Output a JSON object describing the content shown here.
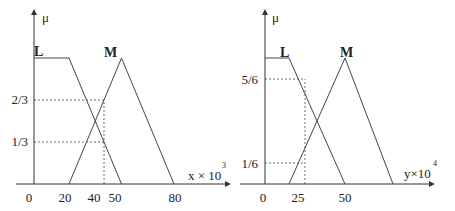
{
  "chart_data": [
    {
      "type": "line",
      "title": "",
      "ylabel": "μ",
      "xlabel": "x × 10",
      "xlabel_exponent": "3",
      "xticks": [
        "0",
        "20",
        "40",
        "50",
        "80"
      ],
      "yticks": [
        "1/3",
        "2/3"
      ],
      "series": [
        {
          "name": "L",
          "points": [
            [
              0,
              1
            ],
            [
              20,
              1
            ],
            [
              50,
              0
            ]
          ]
        },
        {
          "name": "M",
          "points": [
            [
              20,
              0
            ],
            [
              50,
              1
            ],
            [
              80,
              0
            ]
          ]
        }
      ],
      "annotations": [
        {
          "type": "dashed-vertical",
          "x": 40,
          "to_y": 0.6667
        },
        {
          "type": "dashed-horizontal",
          "y": 0.6667,
          "to_x": 40
        },
        {
          "type": "dashed-horizontal",
          "y": 0.3333,
          "to_x": 40
        }
      ]
    },
    {
      "type": "line",
      "title": "",
      "ylabel": "μ",
      "xlabel": "y×10",
      "xlabel_exponent": "4",
      "xticks": [
        "0",
        "25",
        "50"
      ],
      "yticks": [
        "1/6",
        "5/6"
      ],
      "series": [
        {
          "name": "L",
          "points": [
            [
              0,
              1
            ],
            [
              15,
              1
            ],
            [
              50,
              0
            ]
          ]
        },
        {
          "name": "M",
          "points": [
            [
              15,
              0
            ],
            [
              50,
              1
            ],
            [
              80,
              0
            ]
          ]
        }
      ],
      "annotations": [
        {
          "type": "dashed-vertical",
          "x": 25,
          "to_y": 0.8333
        },
        {
          "type": "dashed-horizontal",
          "y": 0.8333,
          "to_x": 25
        },
        {
          "type": "dashed-horizontal",
          "y": 0.1667,
          "to_x": 25
        }
      ]
    }
  ]
}
